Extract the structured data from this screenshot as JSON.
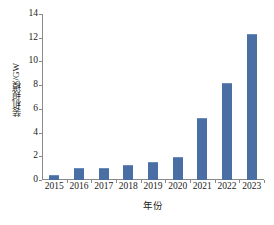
{
  "chart_data": {
    "type": "bar",
    "title": "",
    "subtitle": "",
    "xlabel": "年份",
    "ylabel": "装机规模/GW",
    "categories": [
      "2015",
      "2016",
      "2017",
      "2018",
      "2019",
      "2020",
      "2021",
      "2022",
      "2023"
    ],
    "values": [
      0.45,
      1.0,
      1.05,
      1.25,
      1.5,
      1.95,
      5.2,
      8.2,
      12.3
    ],
    "ylim": [
      0,
      14
    ],
    "ytick_values": [
      0,
      2,
      4,
      6,
      8,
      10,
      12,
      14
    ],
    "ytick_labels": [
      "0",
      "2",
      "4",
      "6",
      "8",
      "10",
      "12",
      "14"
    ],
    "grid": false,
    "legend": null,
    "legend_position": "none",
    "annotations": [],
    "series": [
      {
        "name": "装机规模",
        "values": [
          0.45,
          1.0,
          1.05,
          1.25,
          1.5,
          1.95,
          5.2,
          8.2,
          12.3
        ]
      }
    ]
  },
  "style": {
    "bar_color": "#4a6fa5",
    "bar_edge_color": "#6b8cba",
    "axis_color": "#8a8a8a",
    "text_color": "#1a1a1a",
    "background_color": "#ffffff"
  }
}
